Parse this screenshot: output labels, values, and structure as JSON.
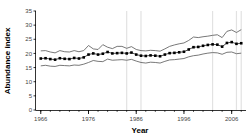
{
  "figure": {
    "background": "#ffffff",
    "caption_fragment": ""
  },
  "chart_data": {
    "type": "line",
    "title": "",
    "xlabel": "Year",
    "ylabel": "Abundance index",
    "xlim": [
      1965,
      2009
    ],
    "ylim": [
      0,
      35
    ],
    "yticks": [
      0,
      5,
      10,
      15,
      20,
      25,
      30,
      35
    ],
    "xticks": [
      1966,
      1976,
      1986,
      1996,
      2006
    ],
    "xtick_labels": [
      "1966",
      "1976",
      "1986",
      "1996",
      "2006"
    ],
    "ytick_labels": [
      "0",
      "5",
      "10",
      "15",
      "20",
      "25",
      "30",
      "35"
    ],
    "grid": "vertical-faint",
    "gridlines_x": [
      1984,
      1987,
      2002,
      2007,
      2008
    ],
    "legend": "none",
    "marker": "filled-square",
    "line_color": "#000000",
    "bound_color": "#555555",
    "x": [
      1966,
      1967,
      1968,
      1969,
      1970,
      1971,
      1972,
      1973,
      1974,
      1975,
      1976,
      1977,
      1978,
      1979,
      1980,
      1981,
      1982,
      1983,
      1984,
      1985,
      1986,
      1987,
      1988,
      1989,
      1990,
      1991,
      1992,
      1993,
      1994,
      1995,
      1996,
      1997,
      1998,
      1999,
      2000,
      2001,
      2002,
      2003,
      2004,
      2005,
      2006,
      2007,
      2008
    ],
    "series": [
      {
        "name": "Abundance index",
        "values": [
          18.2,
          18.3,
          18.0,
          17.8,
          18.3,
          18.1,
          18.0,
          18.4,
          18.2,
          18.6,
          19.6,
          20.0,
          19.6,
          19.9,
          20.5,
          20.0,
          20.1,
          20.2,
          20.0,
          20.3,
          19.6,
          19.2,
          19.1,
          19.3,
          19.2,
          19.0,
          19.6,
          20.1,
          20.2,
          20.4,
          20.6,
          21.4,
          22.2,
          22.3,
          22.7,
          23.0,
          23.2,
          23.1,
          22.4,
          23.7,
          24.0,
          23.4,
          23.6
        ]
      },
      {
        "name": "Upper bound",
        "values": [
          20.9,
          21.0,
          20.5,
          20.2,
          21.0,
          20.6,
          20.5,
          21.0,
          20.6,
          21.0,
          22.8,
          21.6,
          21.4,
          23.1,
          22.2,
          21.7,
          22.5,
          22.5,
          21.8,
          22.4,
          21.4,
          21.0,
          20.9,
          21.1,
          21.0,
          20.8,
          21.6,
          22.5,
          23.0,
          23.4,
          23.7,
          24.6,
          25.8,
          25.6,
          25.9,
          26.1,
          26.4,
          26.6,
          25.6,
          27.8,
          28.3,
          27.4,
          28.4
        ]
      },
      {
        "name": "Lower bound",
        "values": [
          15.6,
          15.8,
          15.5,
          15.4,
          15.8,
          15.7,
          15.6,
          15.9,
          15.8,
          16.2,
          16.8,
          17.5,
          17.2,
          17.1,
          18.0,
          17.6,
          17.7,
          17.8,
          17.6,
          17.9,
          17.3,
          16.8,
          16.6,
          16.9,
          16.8,
          16.6,
          17.2,
          17.7,
          17.8,
          18.0,
          18.2,
          18.8,
          19.2,
          19.4,
          19.8,
          20.1,
          20.3,
          20.2,
          19.7,
          20.4,
          20.5,
          19.9,
          20.1
        ]
      }
    ]
  }
}
